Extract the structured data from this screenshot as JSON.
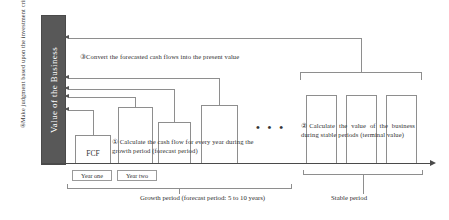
{
  "diagram": {
    "title_caption_left": "④Make judgment based upon the investment criteria",
    "value_column_label": "Value of the Business",
    "notes": {
      "step3": "③Convert the forecasted cash flows into the present value",
      "step1": "① Calculate the cash flow for every year during the growth period (forecast period)",
      "step2": "②Calculate the value of the business during stable periods (terminal value)"
    },
    "fcf_label": "FCF",
    "ellipsis": "• • •",
    "year_boxes": [
      {
        "label": "Year one"
      },
      {
        "label": "Year two"
      }
    ],
    "period_labels": {
      "growth": "Growth period (forecast period: 5 to 10 years)",
      "stable": "Stable period"
    },
    "colors": {
      "value_column": "#585858",
      "outline": "#8e8e8e",
      "axis": "#4a4a4a",
      "text": "#2f2f2f"
    }
  }
}
